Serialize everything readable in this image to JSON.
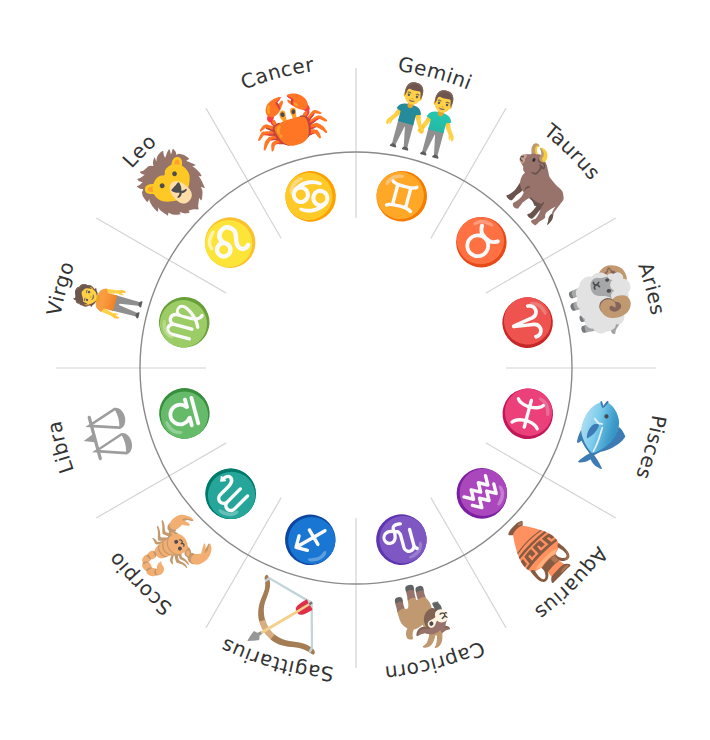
{
  "diagram": {
    "center": [
      356,
      368
    ],
    "inner_radius": 216,
    "outer_radius": 300,
    "label_radius": 300,
    "colors": {
      "background": "#ffffff",
      "divider": "#d4d4d4",
      "inner_circle": "#8a8a8a",
      "label": "#333333",
      "glyph": "#1a1a1a",
      "creature_light": "#8c8c8c",
      "creature_dark": "#2b2b2b"
    }
  },
  "signs": [
    {
      "name": "Gemini",
      "glyph": "♊",
      "symbol_icon": "gemini-twins-icon",
      "creature_icon": "twins-icon",
      "angle": -75
    },
    {
      "name": "Taurus",
      "glyph": "♉",
      "symbol_icon": "taurus-bull-icon",
      "creature_icon": "bull-icon",
      "angle": -45
    },
    {
      "name": "Aries",
      "glyph": "♈",
      "symbol_icon": "aries-ram-icon",
      "creature_icon": "ram-icon",
      "angle": -15
    },
    {
      "name": "Pisces",
      "glyph": "♓",
      "symbol_icon": "pisces-fish-icon",
      "creature_icon": "fish-icon",
      "angle": 15
    },
    {
      "name": "Aquarius",
      "glyph": "♒",
      "symbol_icon": "aquarius-water-icon",
      "creature_icon": "water-jar-icon",
      "angle": 45
    },
    {
      "name": "Capricorn",
      "glyph": "♑",
      "symbol_icon": "capricorn-goat-icon",
      "creature_icon": "sea-goat-icon",
      "angle": 75
    },
    {
      "name": "Sagittarius",
      "glyph": "♐",
      "symbol_icon": "sagittarius-arrow-icon",
      "creature_icon": "centaur-archer-icon",
      "angle": 105
    },
    {
      "name": "Scorpio",
      "glyph": "♏",
      "symbol_icon": "scorpio-scorpion-icon",
      "creature_icon": "scorpion-icon",
      "angle": 135
    },
    {
      "name": "Libra",
      "glyph": "♎",
      "symbol_icon": "libra-scales-icon",
      "creature_icon": "scales-icon",
      "angle": 165
    },
    {
      "name": "Virgo",
      "glyph": "♍",
      "symbol_icon": "virgo-maiden-icon",
      "creature_icon": "maiden-icon",
      "angle": 195
    },
    {
      "name": "Leo",
      "glyph": "♌",
      "symbol_icon": "leo-lion-icon",
      "creature_icon": "lion-icon",
      "angle": 225
    },
    {
      "name": "Cancer",
      "glyph": "♋",
      "symbol_icon": "cancer-crab-icon",
      "creature_icon": "crab-icon",
      "angle": 255
    }
  ]
}
